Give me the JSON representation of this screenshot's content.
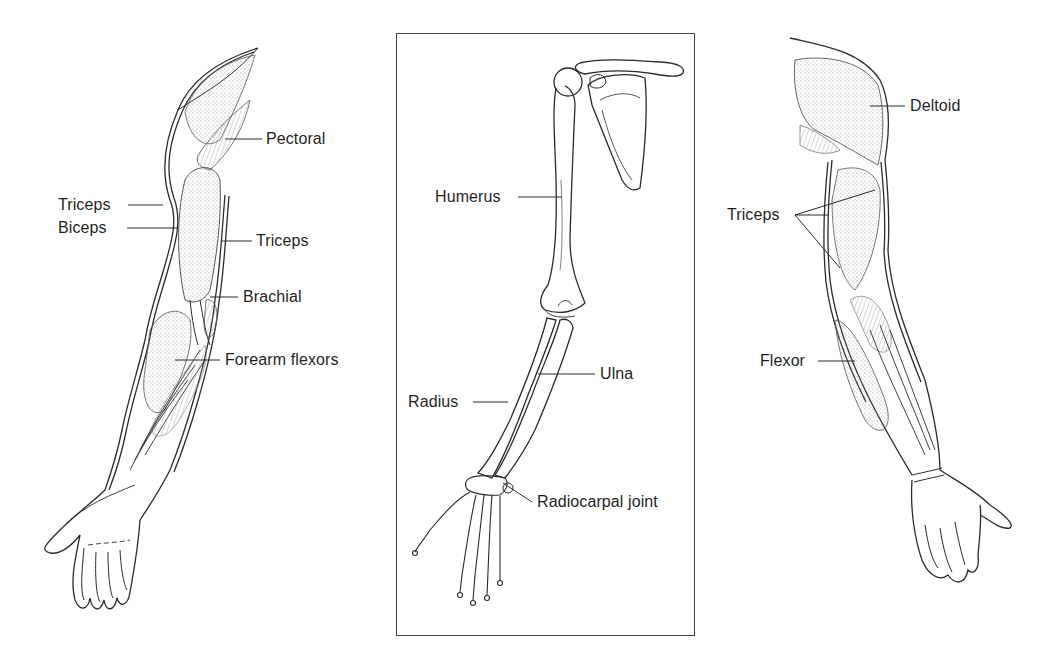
{
  "figure": {
    "colors": {
      "line": "#2a2a2a",
      "shade": "#b8b8b8",
      "background": "#ffffff"
    }
  },
  "panels": {
    "left": {
      "name": "Anterior arm muscles",
      "labels": {
        "pectoral": "Pectoral",
        "triceps_left": "Triceps",
        "biceps": "Biceps",
        "triceps_right": "Triceps",
        "brachial": "Brachial",
        "forearm_flexors": "Forearm flexors"
      }
    },
    "center": {
      "name": "Arm skeleton",
      "labels": {
        "humerus": "Humerus",
        "ulna": "Ulna",
        "radius": "Radius",
        "radiocarpal_joint": "Radiocarpal joint"
      }
    },
    "right": {
      "name": "Posterior arm muscles",
      "labels": {
        "deltoid": "Deltoid",
        "triceps": "Triceps",
        "flexor": "Flexor"
      }
    }
  }
}
